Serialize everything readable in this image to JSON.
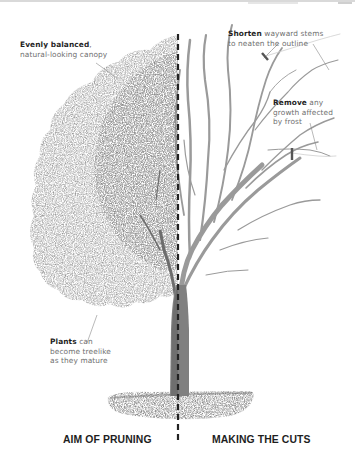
{
  "figure": {
    "headings": {
      "left": "AIM OF PRUNING",
      "right": "MAKING THE CUTS"
    },
    "annotations": [
      {
        "id": "canopy",
        "bold": "Evenly balanced",
        "rest_line1": ",",
        "rest_line2": "natural-looking canopy"
      },
      {
        "id": "shorten",
        "bold": "Shorten",
        "rest_line1": " wayward stems",
        "rest_line2": "to neaten the outline"
      },
      {
        "id": "remove",
        "bold": "Remove",
        "rest_line1": " any",
        "rest_line2": "growth affected",
        "rest_line3": "by frost"
      },
      {
        "id": "plants",
        "bold": "Plants",
        "rest_line1": " can",
        "rest_line2": "become treelike",
        "rest_line3": "as they mature"
      }
    ],
    "colors": {
      "canopy": "#8a8a8a",
      "branches": "#9a9a9a",
      "trunk": "#7d7d7d",
      "ground": "#8c8c8c",
      "divider": "#222222",
      "cut_marker": "#555555"
    }
  }
}
